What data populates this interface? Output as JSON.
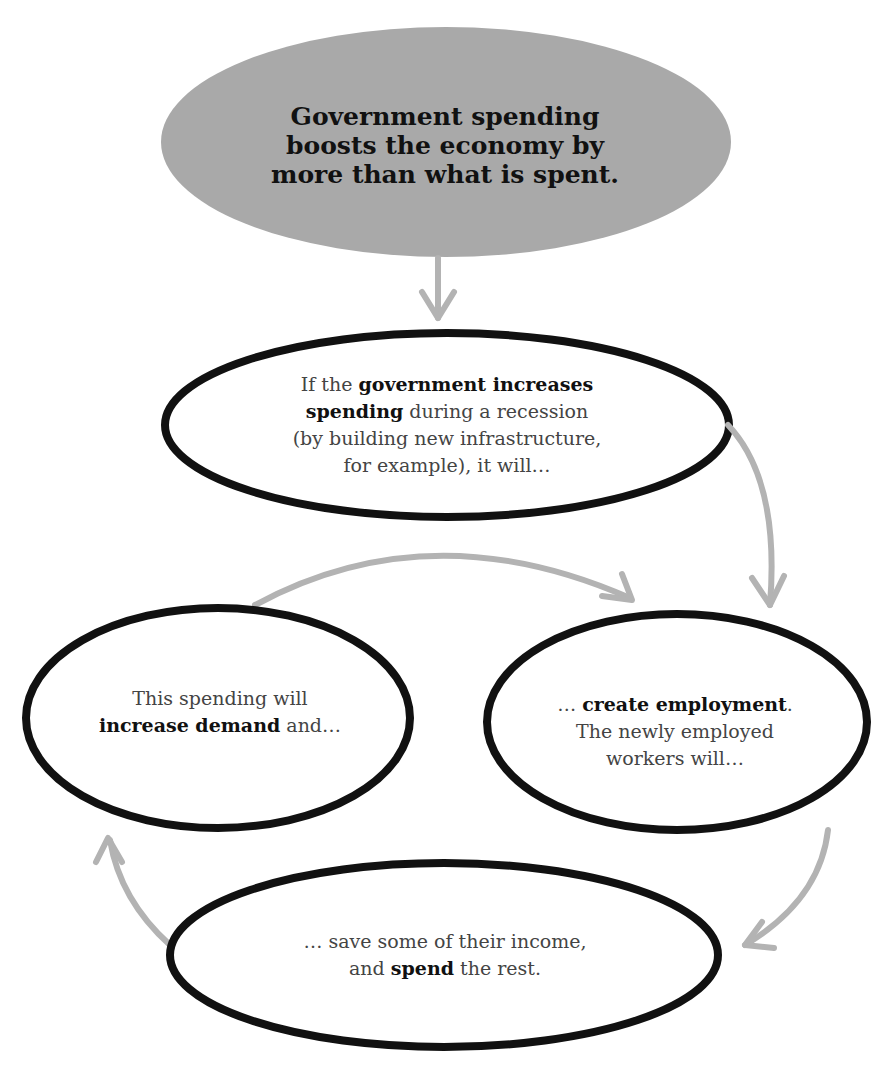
{
  "colors": {
    "title_fill": "#a9a9a9",
    "outline": "#111111",
    "arrow": "#b3b3b3",
    "body_text": "#444444",
    "bold_text": "#111111"
  },
  "title": {
    "lines": [
      "Government spending",
      "boosts the economy by",
      "more than what is spent."
    ]
  },
  "nodes": {
    "government": {
      "l1_pre": "If the ",
      "l1_bold": "government increases",
      "l2_bold": "spending",
      "l2_post": " during a recession",
      "l3": "(by building new infrastructure,",
      "l4": "for example), it will…"
    },
    "employment": {
      "l1_pre": "… ",
      "l1_bold": "create employment",
      "l1_post": ".",
      "l2": "The newly employed",
      "l3": "workers will…"
    },
    "spend": {
      "l1": "… save some of their income,",
      "l2_pre": "and ",
      "l2_bold": "spend",
      "l2_post": " the rest."
    },
    "demand": {
      "l1": "This spending will",
      "l2_bold": "increase demand",
      "l2_post": " and…"
    }
  },
  "flow": [
    "title -> government",
    "government -> employment",
    "employment -> spend",
    "spend -> demand",
    "demand -> employment"
  ]
}
